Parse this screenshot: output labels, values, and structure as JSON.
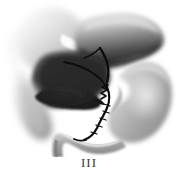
{
  "figure": {
    "caption": "III",
    "background_color": "#ffffff",
    "style": "grayscale airbrush medical illustration"
  },
  "palette": {
    "background": "#ffffff",
    "liver_left_lobe_light": "#e8e8e8",
    "liver_left_lobe_mid": "#c9c9c9",
    "liver_right_lobe_dark": "#3a3a3a",
    "liver_right_lobe_light": "#b8b8b8",
    "liver_inferior_dark": "#2f2f2f",
    "gallbladder_dark": "#242424",
    "stomach_mid_gray": "#a5a5a5",
    "stomach_light": "#d8d8d8",
    "duodenum_gray": "#9a9a9a",
    "duct_black": "#0d0d0d",
    "falciform_white": "#fbfbfb",
    "caption_color": "#3a3a3a"
  },
  "structures": [
    {
      "id": "liver-left-lobe",
      "label": "Left lobe of liver",
      "region": "upper-left",
      "tone": "light gray gradient fading to white at left margin"
    },
    {
      "id": "liver-right-lobe",
      "label": "Right lobe of liver",
      "region": "upper-right",
      "tone": "gradient light top to dark charcoal bottom edge"
    },
    {
      "id": "falciform-ligament",
      "label": "Falciform ligament notch",
      "region": "upper-center",
      "tone": "white triangular wedge"
    },
    {
      "id": "liver-inferior-surface",
      "label": "Inferior surface of liver",
      "region": "center-left",
      "tone": "dark charcoal mass"
    },
    {
      "id": "gallbladder",
      "label": "Gallbladder",
      "region": "center-left-lower",
      "tone": "near-black elongated oval"
    },
    {
      "id": "cystic-duct",
      "label": "Cystic duct",
      "region": "center",
      "tone": "black zigzag spiral line"
    },
    {
      "id": "common-hepatic-duct",
      "label": "Common hepatic duct",
      "region": "center-upper",
      "tone": "black curving line"
    },
    {
      "id": "common-bile-duct",
      "label": "Common bile duct",
      "region": "center-lower",
      "tone": "black descending line into duodenum"
    },
    {
      "id": "stomach",
      "label": "Stomach",
      "region": "right",
      "tone": "mid gray J-shaped body with light highlight"
    },
    {
      "id": "duodenum",
      "label": "Duodenum",
      "region": "bottom-center",
      "tone": "gray C-shaped tube curving to lower left"
    }
  ]
}
